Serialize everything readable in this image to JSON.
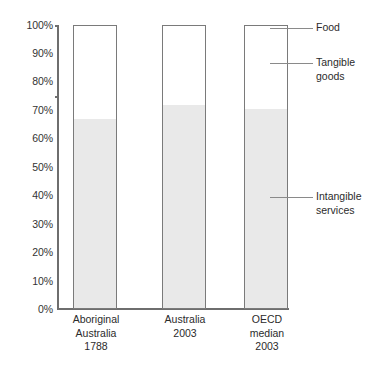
{
  "chart_data": {
    "type": "bar",
    "title": "",
    "subtitle": "",
    "xlabel": "",
    "ylabel": "",
    "ylim": [
      0,
      100
    ],
    "grid": false,
    "stacked": true,
    "legend_position": "right",
    "categories": [
      "Aboriginal\nAustralia\n1788",
      "Australia\n2003",
      "OECD\nmedian\n2003"
    ],
    "category_lines": [
      [
        "Aboriginal",
        "Australia",
        "1788"
      ],
      [
        "Australia",
        "2003"
      ],
      [
        "OECD",
        "median",
        "2003"
      ]
    ],
    "series": [
      {
        "name": "Intangible services",
        "values": [
          67,
          72,
          70.5
        ]
      },
      {
        "name": "Tangible goods",
        "values": [
          null,
          null,
          null
        ]
      },
      {
        "name": "Food",
        "values": [
          null,
          null,
          null
        ]
      }
    ],
    "tick_labels": [
      "0%",
      "10%",
      "20%",
      "30%",
      "40%",
      "50%",
      "60%",
      "70%",
      "80%",
      "90%",
      "100%"
    ],
    "tick_values": [
      0,
      10,
      20,
      30,
      40,
      50,
      60,
      70,
      80,
      90,
      100
    ],
    "legend": [
      {
        "label_lines": [
          "Food"
        ],
        "label": "Food"
      },
      {
        "label_lines": [
          "Tangible",
          "goods"
        ],
        "label": "Tangible goods"
      },
      {
        "label_lines": [
          "Intangible",
          "services"
        ],
        "label": "Intangible services"
      }
    ],
    "colors": {
      "intangible_fill": "#e9e9e9",
      "bar_outline": "#7a7a7a",
      "axis": "#6e6e6e",
      "text": "#2b2b2b",
      "leader": "#8a8a8a"
    }
  },
  "axis": {
    "ticks": [
      {
        "label": "100%"
      },
      {
        "label": "90%"
      },
      {
        "label": "80%"
      },
      {
        "label": "70%"
      },
      {
        "label": "60%"
      },
      {
        "label": "50%"
      },
      {
        "label": "40%"
      },
      {
        "label": "30%"
      },
      {
        "label": "20%"
      },
      {
        "label": "10%"
      },
      {
        "label": "0%"
      }
    ]
  },
  "bars": [
    {
      "line1": "Aboriginal",
      "line2": "Australia",
      "line3": "1788"
    },
    {
      "line1": "Australia",
      "line2": "2003",
      "line3": ""
    },
    {
      "line1": "OECD",
      "line2": "median",
      "line3": "2003"
    }
  ],
  "legend": {
    "food": {
      "line1": "Food",
      "line2": ""
    },
    "tangible": {
      "line1": "Tangible",
      "line2": "goods"
    },
    "intangible": {
      "line1": "Intangible",
      "line2": "services"
    }
  }
}
